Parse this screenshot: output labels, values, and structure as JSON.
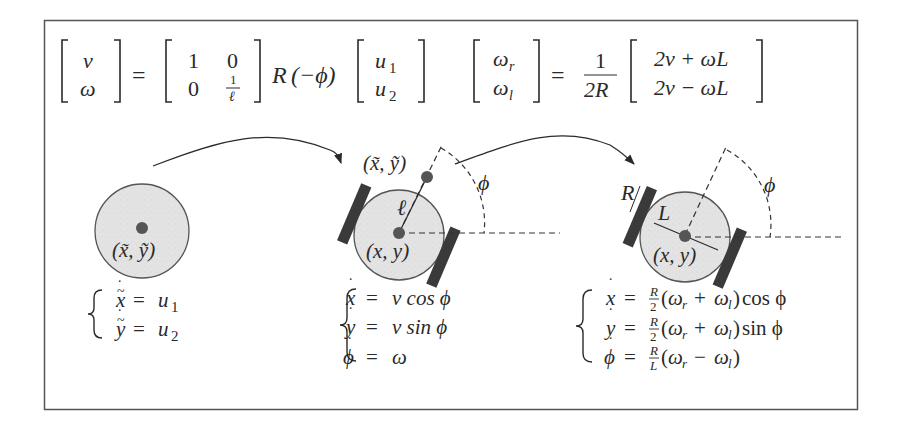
{
  "colors": {
    "frame": "#555555",
    "ink": "#2a2a2a",
    "robot_body": "#e2e2e2",
    "robot_outline": "#555555",
    "wheel": "#3a3a3a",
    "point": "#555555",
    "dashed": "#333333"
  },
  "top_equations": {
    "eq1": {
      "lhs": [
        "v",
        "ω"
      ],
      "equals": "=",
      "matrix": [
        [
          "1",
          "0"
        ],
        [
          "0",
          "1/ℓ"
        ]
      ],
      "matrix_frac_num": "1",
      "matrix_frac_den": "ℓ",
      "rotation": "R(−ϕ)",
      "rotation_R": "R",
      "rotation_arg": "(−ϕ)",
      "rhs": [
        "u",
        "u"
      ],
      "rhs_sub": [
        "1",
        "2"
      ]
    },
    "eq2": {
      "lhs": [
        "ω",
        "ω"
      ],
      "lhs_sub": [
        "r",
        "l"
      ],
      "equals": "=",
      "frac_num": "1",
      "frac_den": "2R",
      "rhs": [
        "2v + ωL",
        "2v − ωL"
      ]
    }
  },
  "models": [
    {
      "name": "point-robot",
      "label_point": "(x̃, ỹ)",
      "equations": [
        "ẋ̃ = u₁",
        "ẏ̃ = u₂"
      ],
      "eq_lhs": [
        "x",
        "y"
      ],
      "eq_rhs": [
        "u",
        "u"
      ],
      "eq_sub": [
        "1",
        "2"
      ]
    },
    {
      "name": "unicycle-robot",
      "label_offset_point": "(x̃, ỹ)",
      "label_center": "(x, y)",
      "label_length": "ℓ",
      "label_angle": "ϕ",
      "equations": [
        "ẋ = v cos ϕ",
        "ẏ = v sin ϕ",
        "ϕ̇ = ω"
      ],
      "eq_lhs": [
        "x",
        "y",
        "ϕ"
      ],
      "eq_rhs": [
        "v cos ϕ",
        "v sin ϕ",
        "ω"
      ]
    },
    {
      "name": "differential-drive-robot",
      "label_center": "(x, y)",
      "label_wheel_radius": "R",
      "label_axle_length": "L",
      "label_angle": "ϕ",
      "equations": [
        "ẋ = R/2 (ωr + ωl) cos ϕ",
        "ẏ = R/2 (ωr + ωl) sin ϕ",
        "ϕ̇ = R/L (ωr − ωl)"
      ],
      "eq_lhs": [
        "x",
        "y",
        "ϕ"
      ],
      "eq_frac_num": [
        "R",
        "R",
        "R"
      ],
      "eq_frac_den": [
        "2",
        "2",
        "L"
      ],
      "eq_tail": [
        "cos ϕ",
        "sin ϕ",
        ""
      ],
      "eq_op": [
        "+",
        "+",
        "−"
      ]
    }
  ],
  "arrows": [
    {
      "from": "point-robot",
      "to": "unicycle-robot"
    },
    {
      "from": "unicycle-robot",
      "to": "differential-drive-robot"
    }
  ]
}
